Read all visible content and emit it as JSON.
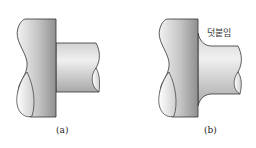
{
  "figure_a": {
    "caption": "(a)"
  },
  "figure_b": {
    "caption": "(b)",
    "annotation": "덧붙임"
  },
  "colors": {
    "outline": "#333333",
    "body_light": "#e6e6e6",
    "body_dark": "#9a9a9a",
    "background": "#ffffff"
  }
}
